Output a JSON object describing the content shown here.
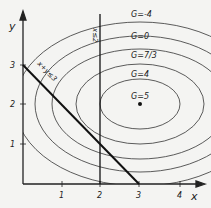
{
  "diagram": {
    "type": "linear-programming-contour-plot",
    "axes": {
      "x_label": "x",
      "y_label": "y",
      "x_ticks": [
        "1",
        "2",
        "3",
        "4"
      ],
      "y_ticks": [
        "1",
        "2",
        "3"
      ]
    },
    "constraints": [
      {
        "label": "x+y≤3",
        "line": "x + y = 3"
      },
      {
        "label": "x≤2",
        "line": "x = 2"
      }
    ],
    "contours": [
      {
        "label": "G=-4",
        "value": -4
      },
      {
        "label": "G=0",
        "value": 0
      },
      {
        "label": "G=7/3",
        "value": "7/3"
      },
      {
        "label": "G=4",
        "value": 4
      },
      {
        "label": "G=5",
        "value": 5,
        "note": "maximum at point (3,2)"
      }
    ],
    "colors": {
      "ink": "#222222",
      "background": "#f4f4f2"
    }
  }
}
